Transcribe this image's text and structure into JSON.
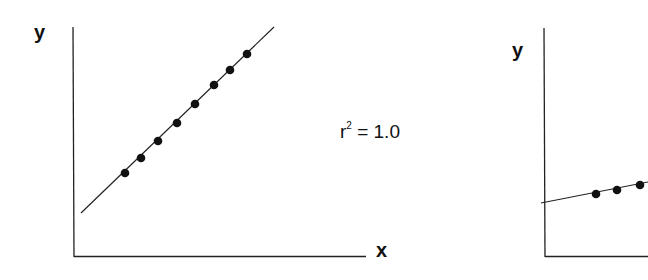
{
  "chart_data": [
    {
      "type": "scatter",
      "title": "",
      "xlabel": "x",
      "ylabel": "y",
      "annotation": "r² = 1.0",
      "grid": false,
      "fit_line": {
        "x1": 81,
        "y1": 213,
        "x2": 274,
        "y2": 27
      },
      "points": [
        {
          "x": 125,
          "y": 173
        },
        {
          "x": 141,
          "y": 158
        },
        {
          "x": 158,
          "y": 141
        },
        {
          "x": 177,
          "y": 123
        },
        {
          "x": 195,
          "y": 104
        },
        {
          "x": 214,
          "y": 85
        },
        {
          "x": 230,
          "y": 70
        },
        {
          "x": 247,
          "y": 54
        }
      ]
    },
    {
      "type": "scatter",
      "title": "",
      "xlabel": "",
      "ylabel": "y",
      "grid": false,
      "fit_line": {
        "x1": 541,
        "y1": 203,
        "x2": 648,
        "y2": 182
      },
      "points": [
        {
          "x": 596,
          "y": 194
        },
        {
          "x": 617,
          "y": 190
        },
        {
          "x": 640,
          "y": 185
        }
      ]
    }
  ],
  "labels": {
    "left_y": "y",
    "left_x": "x",
    "r2_base": "r",
    "r2_sup": "2",
    "r2_value": " = 1.0",
    "right_y": "y"
  }
}
